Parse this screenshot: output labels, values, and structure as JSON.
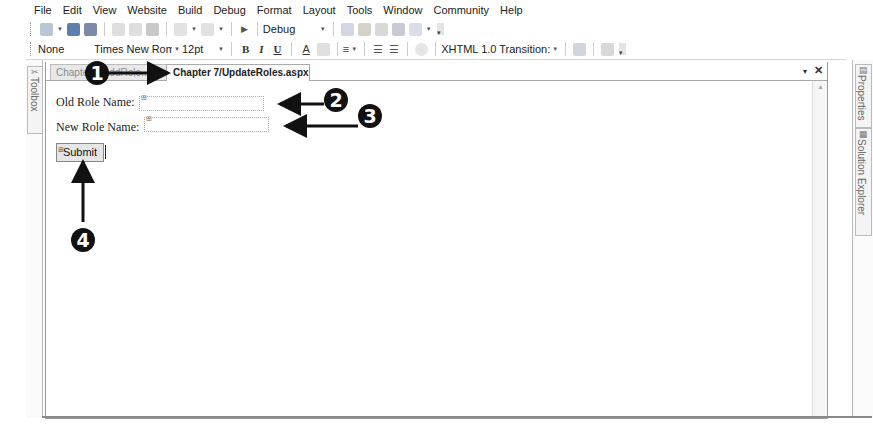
{
  "menubar": {
    "items": [
      "File",
      "Edit",
      "View",
      "Website",
      "Build",
      "Debug",
      "Format",
      "Layout",
      "Tools",
      "Window",
      "Community",
      "Help"
    ]
  },
  "toolbar_standard": {
    "config_value": "Debug"
  },
  "toolbar_formatting": {
    "block_format": "None",
    "font_name": "Times New Roma",
    "font_size": "12pt",
    "bold_label": "B",
    "italic_label": "I",
    "underline_label": "U",
    "doc_type": "XHTML 1.0 Transition:"
  },
  "side_panels": {
    "toolbox": "Toolbox",
    "properties": "Properties",
    "solution_explorer": "Solution Explorer"
  },
  "tabs": [
    {
      "label": "Chapter 7/AddRole...",
      "active": false
    },
    {
      "label": "Chapter 7/UpdateRoles.aspx",
      "active": true
    }
  ],
  "tab_controls": {
    "dropdown": "▾",
    "close": "✕"
  },
  "form": {
    "old_role_label": "Old Role Name:",
    "old_role_value": "",
    "new_role_label": "New Role Name:",
    "new_role_value": "",
    "submit_label": "Submit"
  },
  "callouts": [
    "1",
    "2",
    "3",
    "4"
  ],
  "colors": {
    "callout": "#111111",
    "border": "#999999",
    "inactive_tab": "#e8e8e8"
  }
}
